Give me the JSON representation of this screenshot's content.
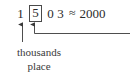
{
  "figure": {
    "type": "place-value-rounding-diagram",
    "background_color": "#ffffff",
    "ink_color": "#2b2b2b",
    "box_color": "#4a4a4a"
  },
  "equation": {
    "digits": [
      {
        "value": "1",
        "boxed": false,
        "place": "thousands"
      },
      {
        "value": "5",
        "boxed": true,
        "place": "hundreds"
      },
      {
        "value": "0",
        "boxed": false,
        "place": "tens"
      },
      {
        "value": "3",
        "boxed": false,
        "place": "ones"
      }
    ],
    "number": "1503",
    "approx_symbol": "≈",
    "result": "2000"
  },
  "annotations": {
    "thousands_pointer": {
      "target_digit": "1",
      "shape": "vertical-arrow",
      "direction": "up"
    },
    "hundreds_pointer": {
      "target_digit": "5",
      "shape": "elbow-arrow",
      "direction": "up"
    }
  },
  "caption": {
    "line1": "thousands",
    "line2": "place"
  }
}
